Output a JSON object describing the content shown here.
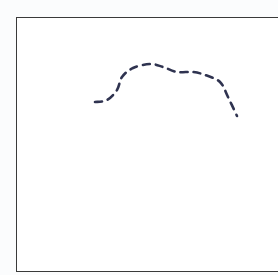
{
  "diagram": {
    "type": "dashed-curve-in-box",
    "frame": {
      "left": 16,
      "top": 17,
      "bottom": 272,
      "right_border_visible": false
    },
    "curve": {
      "style": "dashed",
      "color": "#2f3350",
      "points": [
        [
          95,
          102
        ],
        [
          107,
          100
        ],
        [
          117,
          90
        ],
        [
          122,
          77
        ],
        [
          133,
          68
        ],
        [
          150,
          64
        ],
        [
          163,
          67
        ],
        [
          177,
          72
        ],
        [
          193,
          72
        ],
        [
          205,
          75
        ],
        [
          220,
          82
        ],
        [
          228,
          97
        ],
        [
          237,
          116
        ]
      ]
    }
  }
}
